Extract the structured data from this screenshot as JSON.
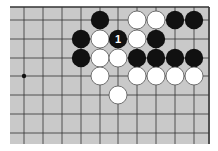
{
  "diagram": {
    "type": "go-board",
    "colors": {
      "board": "#c9c9c9",
      "line": "#333333",
      "black": "#111111",
      "white": "#ffffff"
    },
    "grid": {
      "x": [
        24,
        43,
        62,
        81,
        100,
        118,
        137,
        156,
        175,
        194
      ],
      "y": [
        20,
        39,
        58,
        76,
        95,
        114,
        133
      ],
      "top_edge_y": 7,
      "right_edge_x": 209
    },
    "hoshi": [
      {
        "col": 0,
        "row": 3
      }
    ],
    "stones": [
      {
        "color": "black",
        "col": 4,
        "row": 0
      },
      {
        "color": "white",
        "col": 6,
        "row": 0
      },
      {
        "color": "white",
        "col": 7,
        "row": 0
      },
      {
        "color": "black",
        "col": 8,
        "row": 0
      },
      {
        "color": "black",
        "col": 9,
        "row": 0
      },
      {
        "color": "black",
        "col": 3,
        "row": 1
      },
      {
        "color": "white",
        "col": 4,
        "row": 1
      },
      {
        "color": "black",
        "col": 5,
        "row": 1,
        "label": "1"
      },
      {
        "color": "white",
        "col": 6,
        "row": 1
      },
      {
        "color": "black",
        "col": 7,
        "row": 1
      },
      {
        "color": "black",
        "col": 3,
        "row": 2
      },
      {
        "color": "white",
        "col": 4,
        "row": 2
      },
      {
        "color": "white",
        "col": 5,
        "row": 2
      },
      {
        "color": "black",
        "col": 6,
        "row": 2
      },
      {
        "color": "black",
        "col": 7,
        "row": 2
      },
      {
        "color": "black",
        "col": 8,
        "row": 2
      },
      {
        "color": "black",
        "col": 9,
        "row": 2
      },
      {
        "color": "white",
        "col": 4,
        "row": 3
      },
      {
        "color": "white",
        "col": 6,
        "row": 3
      },
      {
        "color": "white",
        "col": 7,
        "row": 3
      },
      {
        "color": "white",
        "col": 8,
        "row": 3
      },
      {
        "color": "white",
        "col": 9,
        "row": 3
      },
      {
        "color": "white",
        "col": 5,
        "row": 4
      }
    ]
  }
}
